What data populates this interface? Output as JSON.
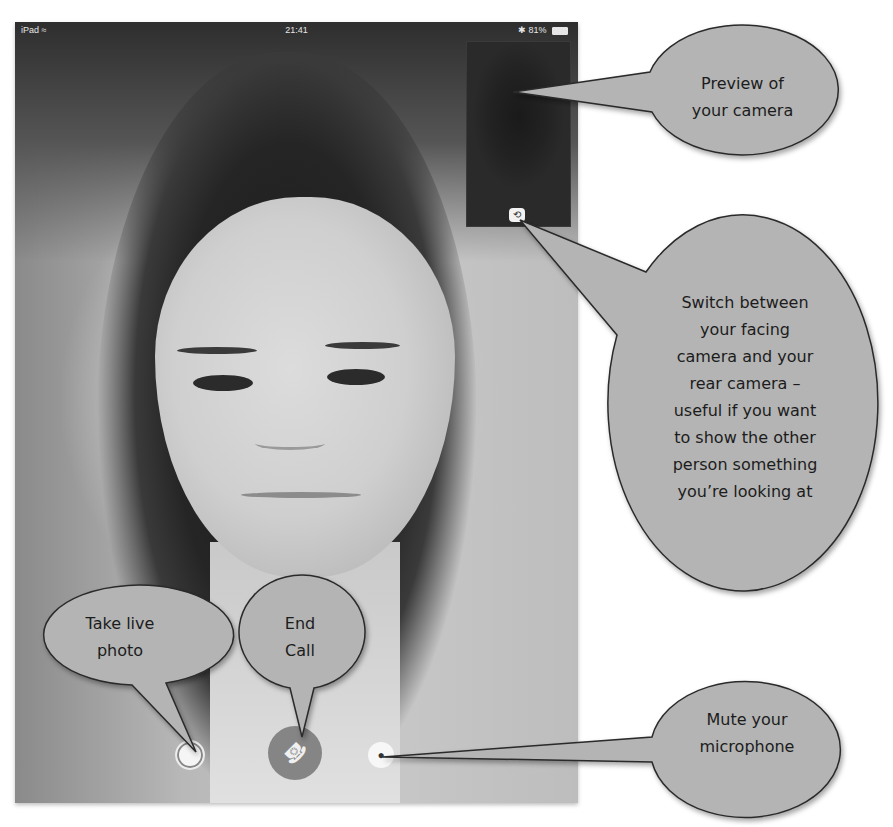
{
  "status_bar": {
    "device": "iPad",
    "wifi_icon": "wifi-icon",
    "time": "21:41",
    "bluetooth_icon": "bluetooth-icon",
    "battery_percent": "81%",
    "battery_icon": "battery-icon"
  },
  "call": {
    "remote_video": "remote-participant-video",
    "self_preview": "self-camera-preview",
    "switch_camera_glyph": "⟲",
    "controls": {
      "take_photo_glyph": "◎",
      "end_call_glyph": "☎",
      "mute_glyph": "🎤"
    }
  },
  "callouts": {
    "preview": {
      "lines": [
        "Preview of",
        "your camera"
      ]
    },
    "switch_camera": {
      "lines": [
        "Switch between",
        "your facing",
        "camera and your",
        "rear camera –",
        "useful if you want",
        "to show the other",
        "person something",
        "you’re looking at"
      ]
    },
    "take_photo": {
      "lines": [
        "Take live",
        "photo"
      ]
    },
    "end_call": {
      "lines": [
        "End",
        "Call"
      ]
    },
    "mute": {
      "lines": [
        "Mute your",
        "microphone"
      ]
    }
  },
  "colors": {
    "bubble_fill": "#b4b4b4",
    "bubble_stroke": "#2a2a2a",
    "end_call_button": "#858585"
  }
}
